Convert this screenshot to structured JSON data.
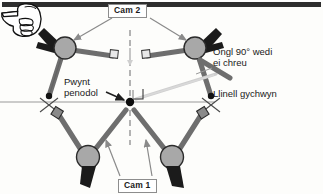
{
  "figure": {
    "type": "mechanical-linkage-diagram",
    "language": "cy",
    "background_color": "#fdfdfb",
    "border_color": "#2e2e2e"
  },
  "labels": {
    "cam2": "Cam 2",
    "cam1": "Cam 1",
    "ongl": "Ongl 90° wedi",
    "ongl_line2": "ei chreu",
    "llinell": "Llinell gychwyn",
    "pwynt": "Pwynt",
    "pwynt_line2": "penodol"
  },
  "icons": {
    "hand": "pointing-hand-left-icon"
  },
  "colors": {
    "bar": "#6e6e6e",
    "bar_dark": "#4a4a4a",
    "joint_fill": "#a8a8a8",
    "joint_stroke": "#2b2b2b",
    "clamp": "#1b1b1b",
    "baseline": "#9a9a9a",
    "dashed": "#8d8d8d",
    "arrow": "#8a8a8a",
    "arrow_dark": "#2b2b2b",
    "text": "#1a1a1a"
  },
  "geometry": {
    "center_point": {
      "x": 130,
      "y": 102
    },
    "baseline_y": 102,
    "axis_x": 130,
    "right_angle_deg": 90
  }
}
